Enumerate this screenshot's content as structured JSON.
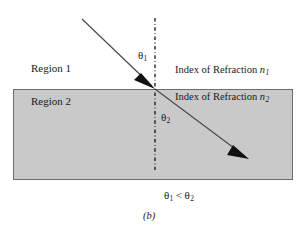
{
  "figure": {
    "caption": "(b)",
    "relation": {
      "left_symbol": "θ",
      "left_sub": "1",
      "operator": "<",
      "right_symbol": "θ",
      "right_sub": "2"
    }
  },
  "regions": [
    {
      "name": "region-1",
      "label": "Region 1",
      "fill": "#ffffff"
    },
    {
      "name": "region-2",
      "label": "Region 2",
      "fill": "#c9c9c9"
    }
  ],
  "indices": [
    {
      "name": "index-1",
      "text": "Index of Refraction",
      "symbol": "n",
      "sub": "1"
    },
    {
      "name": "index-2",
      "text": "Index of Refraction",
      "symbol": "n",
      "sub": "2"
    }
  ],
  "angles": [
    {
      "name": "theta-1",
      "symbol": "θ",
      "sub": "1"
    },
    {
      "name": "theta-2",
      "symbol": "θ",
      "sub": "2"
    }
  ],
  "colors": {
    "slab_fill": "#c9c9c9",
    "slab_border": "#6e6e6e",
    "ray": "#4a4a4a",
    "arrowhead": "#111111",
    "normal_line": "#111111",
    "text": "#1a1a1a",
    "background": "#ffffff"
  },
  "geometry": {
    "slab": {
      "x": 13,
      "y": 89,
      "width": 280,
      "height": 91
    },
    "normal_line": {
      "x": 155,
      "y_top": 18,
      "y_bottom": 170
    },
    "incident_ray": {
      "x1": 82,
      "y1": 19,
      "x2": 155,
      "y2": 89
    },
    "refracted_ray": {
      "x1": 155,
      "y1": 89,
      "x2": 243,
      "y2": 155
    }
  }
}
